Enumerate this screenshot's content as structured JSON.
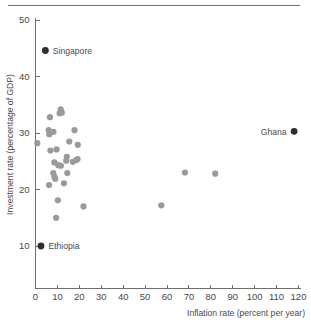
{
  "chart_data": {
    "type": "scatter",
    "title": "",
    "xlabel": "Inflation rate (percent per year)",
    "ylabel": "Investment rate (percentage of GDP)",
    "xlim": [
      0,
      120
    ],
    "ylim": [
      5,
      50
    ],
    "xticks": [
      0,
      10,
      20,
      30,
      40,
      50,
      60,
      70,
      80,
      90,
      100,
      110,
      120
    ],
    "yticks": [
      10,
      20,
      30,
      40,
      50
    ],
    "xtick_labels": [
      "0",
      "10",
      "20",
      "30",
      "40",
      "50",
      "60",
      "70",
      "80",
      "90",
      "100",
      "110",
      "120"
    ],
    "ytick_labels": [
      "10",
      "20",
      "30",
      "40",
      "50"
    ],
    "grid": false,
    "legend": "none",
    "colors": {
      "normal_point": "#9a9a9a",
      "highlight_point": "#2e2e2e",
      "axis": "#6f6f6f",
      "text": "#4a4a4a"
    },
    "annotations": [
      {
        "label": "Singapore",
        "x": 4.5,
        "y": 44.6,
        "highlight": true,
        "label_side": "right"
      },
      {
        "label": "Ethiopia",
        "x": 2.5,
        "y": 10.0,
        "highlight": true,
        "label_side": "right"
      },
      {
        "label": "Ghana",
        "x": 118.0,
        "y": 30.3,
        "highlight": true,
        "label_side": "left"
      }
    ],
    "points": [
      {
        "x": 0.8,
        "y": 28.2
      },
      {
        "x": 6.6,
        "y": 32.8
      },
      {
        "x": 6.0,
        "y": 30.5
      },
      {
        "x": 6.3,
        "y": 29.8
      },
      {
        "x": 8.2,
        "y": 30.2
      },
      {
        "x": 11.5,
        "y": 34.2
      },
      {
        "x": 12.0,
        "y": 33.6
      },
      {
        "x": 11.0,
        "y": 33.5
      },
      {
        "x": 6.8,
        "y": 26.9
      },
      {
        "x": 9.6,
        "y": 27.1
      },
      {
        "x": 8.6,
        "y": 24.8
      },
      {
        "x": 10.4,
        "y": 24.3
      },
      {
        "x": 11.6,
        "y": 24.2
      },
      {
        "x": 8.1,
        "y": 22.9
      },
      {
        "x": 8.6,
        "y": 22.3
      },
      {
        "x": 9.0,
        "y": 21.9
      },
      {
        "x": 6.2,
        "y": 20.8
      },
      {
        "x": 15.4,
        "y": 28.5
      },
      {
        "x": 14.3,
        "y": 25.8
      },
      {
        "x": 14.0,
        "y": 25.1
      },
      {
        "x": 17.8,
        "y": 30.5
      },
      {
        "x": 19.3,
        "y": 27.9
      },
      {
        "x": 17.0,
        "y": 24.9
      },
      {
        "x": 18.6,
        "y": 25.2
      },
      {
        "x": 19.2,
        "y": 25.4
      },
      {
        "x": 14.5,
        "y": 22.9
      },
      {
        "x": 13.0,
        "y": 21.1
      },
      {
        "x": 10.2,
        "y": 18.1
      },
      {
        "x": 9.4,
        "y": 15.0
      },
      {
        "x": 21.9,
        "y": 17.0
      },
      {
        "x": 57.4,
        "y": 17.2
      },
      {
        "x": 68.2,
        "y": 23.0
      },
      {
        "x": 82.0,
        "y": 22.8
      }
    ]
  }
}
